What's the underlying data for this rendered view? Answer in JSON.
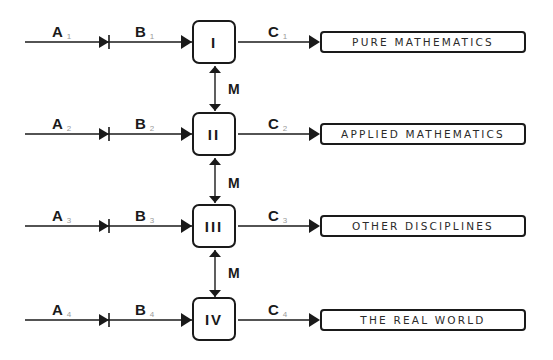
{
  "diagram": {
    "rows": [
      {
        "a": "A",
        "a_sub": "1",
        "b": "B",
        "b_sub": "1",
        "stage": "I",
        "c": "C",
        "c_sub": "1",
        "output": "PURE MATHEMATICS"
      },
      {
        "a": "A",
        "a_sub": "2",
        "b": "B",
        "b_sub": "2",
        "stage": "II",
        "c": "C",
        "c_sub": "2",
        "output": "APPLIED MATHEMATICS"
      },
      {
        "a": "A",
        "a_sub": "3",
        "b": "B",
        "b_sub": "3",
        "stage": "III",
        "c": "C",
        "c_sub": "3",
        "output": "OTHER DISCIPLINES"
      },
      {
        "a": "A",
        "a_sub": "4",
        "b": "B",
        "b_sub": "4",
        "stage": "IV",
        "c": "C",
        "c_sub": "4",
        "output": "THE REAL WORLD"
      }
    ],
    "links": [
      {
        "label": "M",
        "between": [
          "I",
          "II"
        ]
      },
      {
        "label": "M",
        "between": [
          "II",
          "III"
        ]
      },
      {
        "label": "M",
        "between": [
          "III",
          "IV"
        ]
      }
    ]
  }
}
